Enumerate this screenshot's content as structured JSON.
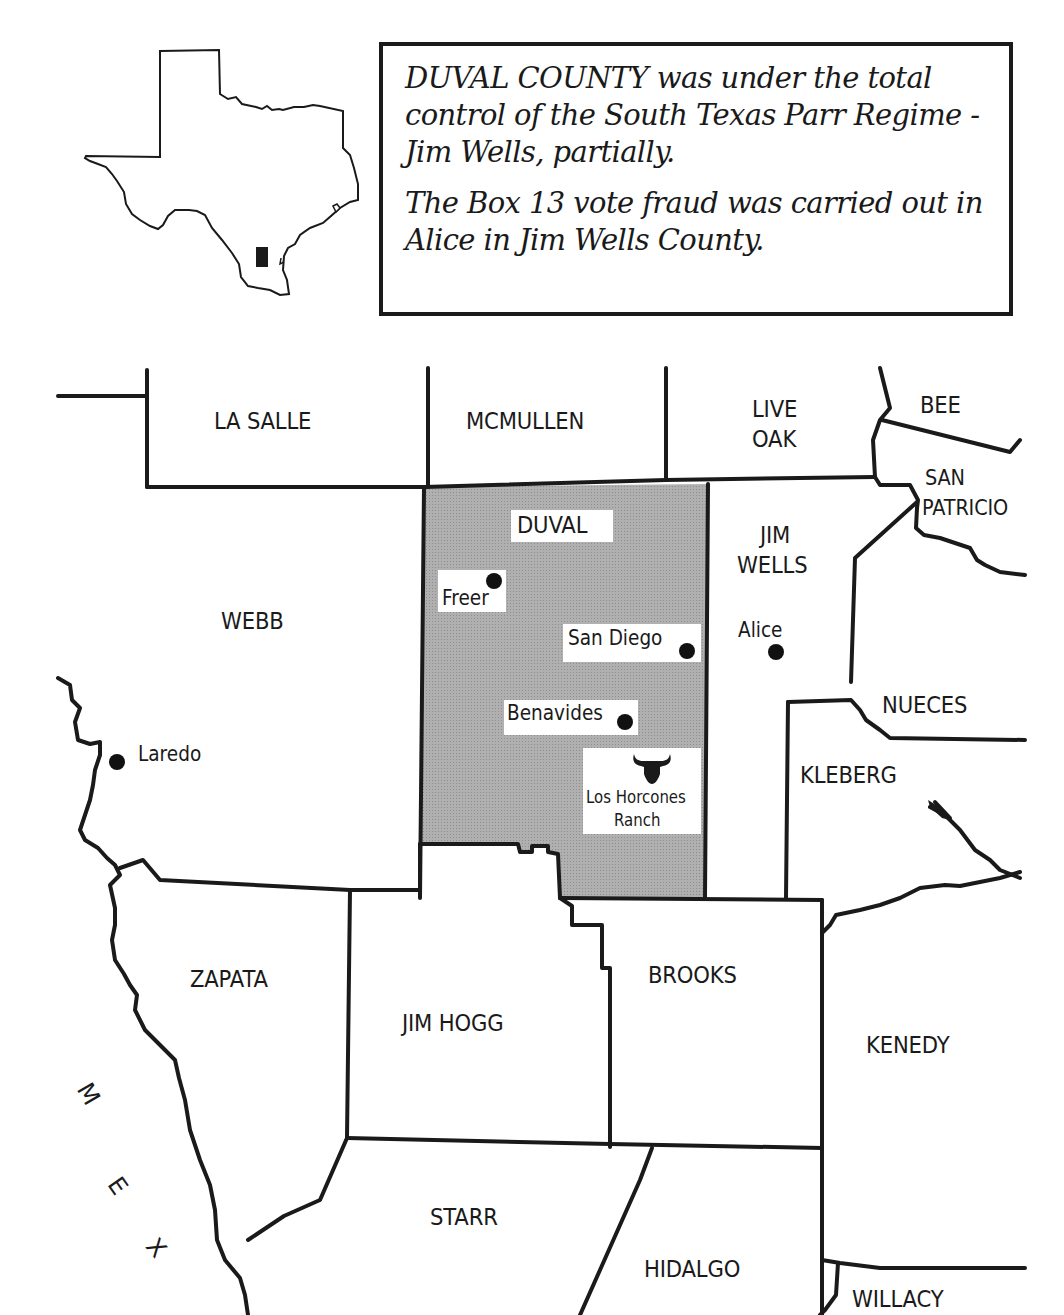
{
  "callout": {
    "paragraphs": [
      "DUVAL COUNTY was under the total control of the South Texas Parr Regime - Jim Wells, partially.",
      "The Box 13 vote fraud was carried out in Alice in Jim Wells County."
    ]
  },
  "inset": {
    "label": "Texas outline with Duval County location marker",
    "marker_color": "#1a1a1a"
  },
  "map": {
    "highlight_color": "#a9a9a9",
    "highlighted_county": "DUVAL",
    "counties": {
      "la_salle": "LA SALLE",
      "mcmullen": "MCMULLEN",
      "live_oak_1": "LIVE",
      "live_oak_2": "OAK",
      "bee": "BEE",
      "san_patricio_1": "SAN",
      "san_patricio_2": "PATRICIO",
      "duval": "DUVAL",
      "jim_wells_1": "JIM",
      "jim_wells_2": "WELLS",
      "webb": "WEBB",
      "nueces": "NUECES",
      "kleberg": "KLEBERG",
      "zapata": "ZAPATA",
      "jim_hogg": "JIM HOGG",
      "brooks": "BROOKS",
      "kenedy": "KENEDY",
      "starr": "STARR",
      "hidalgo": "HIDALGO",
      "willacy": "WILLACY"
    },
    "cities": {
      "freer": "Freer",
      "san_diego": "San Diego",
      "benavides": "Benavides",
      "alice": "Alice",
      "laredo": "Laredo"
    },
    "landmark": {
      "line1": "Los Horcones",
      "line2": "Ranch",
      "icon": "bull-head-icon"
    },
    "country_letters": [
      "M",
      "E",
      "X"
    ]
  }
}
